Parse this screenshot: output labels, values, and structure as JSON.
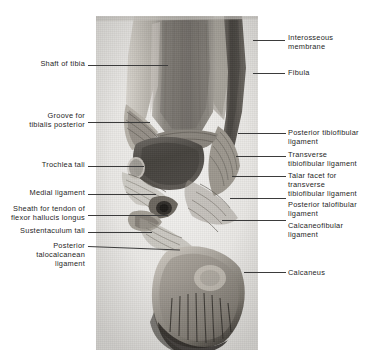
{
  "figure": {
    "kind": "anatomical-illustration",
    "view": "Posterior view of the right ankle joint (dissection photograph)",
    "background_color": "#ffffff",
    "plate_color": "#ededeb",
    "text_color": "#262626",
    "leader_color": "#3b3b3b"
  },
  "labels_left": [
    {
      "id": "shaft-of-tibia",
      "text": "Shaft of tibia"
    },
    {
      "id": "groove-for-tibialis-posterior",
      "text": "Groove for\ntibialis posterior"
    },
    {
      "id": "trochlea-tali",
      "text": "Trochlea tali"
    },
    {
      "id": "medial-ligament",
      "text": "Medial ligament"
    },
    {
      "id": "sheath-flexor-hallucis-longus",
      "text": "Sheath for tendon of\nflexor hallucis longus"
    },
    {
      "id": "sustentaculum-tali",
      "text": "Sustentaculum tali"
    },
    {
      "id": "posterior-talocalcanean-ligament",
      "text": "Posterior\ntalocalcanean\nligament"
    }
  ],
  "labels_right": [
    {
      "id": "interosseous-membrane",
      "text": "Interosseous\nmembrane"
    },
    {
      "id": "fibula",
      "text": "Fibula"
    },
    {
      "id": "posterior-tibiofibular-ligament",
      "text": "Posterior tibiofibular\nligament"
    },
    {
      "id": "transverse-tibiofibular-ligament",
      "text": "Transverse\ntibiofibular ligament"
    },
    {
      "id": "talar-facet-transverse-tibiofibular-ligament",
      "text": "Talar facet for\ntransverse\ntibiofibular ligament"
    },
    {
      "id": "posterior-talofibular-ligament",
      "text": "Posterior talofibular\nligament"
    },
    {
      "id": "calcaneofibular-ligament",
      "text": "Calcaneofibular\nligament"
    },
    {
      "id": "calcaneus",
      "text": "Calcaneus"
    }
  ]
}
